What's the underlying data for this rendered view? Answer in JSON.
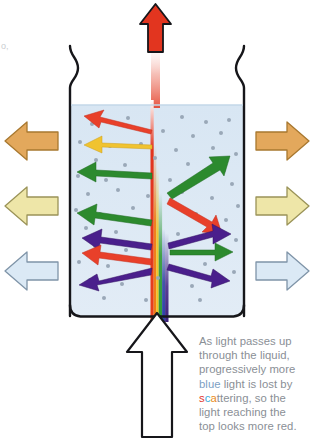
{
  "figure": {
    "caption": {
      "full_text": "As light passes up through the liquid, progressively more blue light is lost by scattering, so the light reaching the top looks more red.",
      "line1": "As light passes up",
      "line2": "through the liquid,",
      "line3": "progressively more",
      "line4_a": "blue",
      "line4_b": " light is lost by",
      "line5_s": "s",
      "line5_c": "c",
      "line5_a": "a",
      "line5_rest": "ttering, so the",
      "line6": "light reaching the",
      "line7": "top looks more red.",
      "text_color": "#8a8f96"
    },
    "stray_mark": "o,"
  },
  "vessel": {
    "name": "beaker",
    "outline_color": "#16161a",
    "liquid_fill": "#dde8f2",
    "liquid_surface_label": "liquid surface",
    "particle_color": "#9aa8b8",
    "particle_count": 58
  },
  "beam": {
    "name": "light-beam",
    "description": "vertical beam entering white at bottom, rainbow spectrum that loses blue and violet with height, emerging red at top",
    "bottom_spectrum": [
      "#e8401c",
      "#f07b14",
      "#f2c21a",
      "#2f9a34",
      "#2b3fa8",
      "#3c1f7a"
    ],
    "top_color": "#e2351f",
    "fade_color": "#ffffff"
  },
  "arrows": {
    "input": {
      "name": "white-light-input-arrow",
      "label": "white light in",
      "fill": "#ffffff",
      "stroke": "#16161a",
      "direction": "up"
    },
    "output": {
      "name": "red-light-output-arrow",
      "label": "red light out",
      "fill": "#e2351f",
      "stroke": "#16161a",
      "direction": "up"
    },
    "external_left": [
      {
        "name": "external-arrow-left-orange",
        "fill": "#e3a85c",
        "stroke": "#a8782f",
        "label": "scattered orange light",
        "direction": "left"
      },
      {
        "name": "external-arrow-left-yellow",
        "fill": "#eee6a8",
        "stroke": "#9a9358",
        "label": "scattered yellow light",
        "direction": "left"
      },
      {
        "name": "external-arrow-left-blue",
        "fill": "#dbe9f5",
        "stroke": "#7f94a8",
        "label": "scattered blue light",
        "direction": "left"
      }
    ],
    "external_right": [
      {
        "name": "external-arrow-right-orange",
        "fill": "#e3a85c",
        "stroke": "#a8782f",
        "label": "scattered orange light",
        "direction": "right"
      },
      {
        "name": "external-arrow-right-yellow",
        "fill": "#eee6a8",
        "stroke": "#9a9358",
        "label": "scattered yellow light",
        "direction": "right"
      },
      {
        "name": "external-arrow-right-blue",
        "fill": "#dbe9f5",
        "stroke": "#7f94a8",
        "label": "scattered blue light",
        "direction": "right"
      }
    ],
    "internal_left": [
      {
        "name": "scatter-arrow-left-red-1",
        "color": "#e8402a"
      },
      {
        "name": "scatter-arrow-left-yellow-1",
        "color": "#f0c330"
      },
      {
        "name": "scatter-arrow-left-green-1",
        "color": "#2c8a2e"
      },
      {
        "name": "scatter-arrow-left-green-2",
        "color": "#2c8a2e"
      },
      {
        "name": "scatter-arrow-left-purple-1",
        "color": "#4a1f8c"
      },
      {
        "name": "scatter-arrow-left-red-2",
        "color": "#e8402a"
      },
      {
        "name": "scatter-arrow-left-purple-2",
        "color": "#4a1f8c"
      }
    ],
    "internal_right": [
      {
        "name": "scatter-arrow-right-green-1",
        "color": "#2c8a2e"
      },
      {
        "name": "scatter-arrow-right-red-1",
        "color": "#e8402a"
      },
      {
        "name": "scatter-arrow-right-purple-1",
        "color": "#4a1f8c"
      },
      {
        "name": "scatter-arrow-right-green-2",
        "color": "#2c8a2e"
      },
      {
        "name": "scatter-arrow-right-purple-2",
        "color": "#4a1f8c"
      }
    ]
  }
}
